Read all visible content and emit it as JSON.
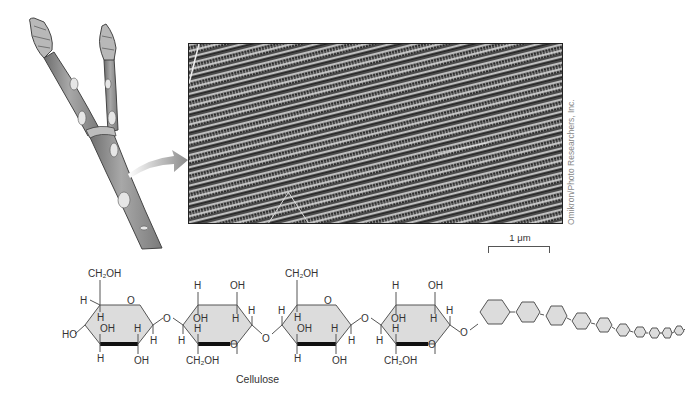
{
  "figure": {
    "caption": "Cellulose",
    "credit": "Omikron/Photo Researchers, Inc.",
    "scale_bar": {
      "label": "1 μm"
    },
    "illustration": {
      "subject": "plant twig with buds",
      "icon": "twig-icon"
    },
    "arrow": {
      "icon": "curved-arrow-icon"
    },
    "micrograph": {
      "subject": "cellulose microfibrils (electron micrograph)"
    }
  },
  "structure": {
    "name": "Cellulose",
    "labels": {
      "ch2oh": "CH₂OH",
      "oh": "OH",
      "h": "H",
      "ho": "HO",
      "o": "O"
    },
    "rings": [
      {
        "top": "CH₂OH",
        "orientation": "up"
      },
      {
        "top": "OH",
        "orientation": "flipped"
      },
      {
        "top": "CH₂OH",
        "orientation": "up"
      },
      {
        "top": "OH",
        "orientation": "flipped"
      }
    ],
    "chain_hexagon_count": 14,
    "colors": {
      "ring_fill": "#dcdcdc",
      "ring_stroke": "#555555",
      "bold_bond": "#111111",
      "text": "#333333"
    }
  }
}
